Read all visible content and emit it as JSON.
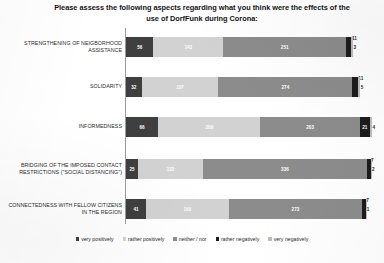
{
  "chart_data": {
    "type": "bar",
    "subtype": "stacked-horizontal-bar",
    "title": "Please assess the following aspects regarding what you think were the effects of the use of DorfFunk during Corona:",
    "xlabel": "",
    "ylabel": "",
    "grid": false,
    "legend_position": "bottom",
    "stacked": true,
    "orientation": "horizontal",
    "categories": [
      "STRENGTHENING OF NEIGBORHOOD ASSISTANCE",
      "SOLIDARITY",
      "INFORMEDNESS",
      "BRIDGING OF THE IMPOSED CONTACT RESTRICTIONS (\"SOCIAL DISTANCING\")",
      "CONNECTEDNESS WITH FELLOW CITIZENS IN THE REGION"
    ],
    "series": [
      {
        "name": "very positively",
        "color": "#3f3f3f",
        "values": [
          56,
          32,
          66,
          25,
          41
        ]
      },
      {
        "name": "rather positively",
        "color": "#d2d2d2",
        "values": [
          143,
          157,
          209,
          132,
          169
        ]
      },
      {
        "name": "neither / nor",
        "color": "#8c8c8c",
        "values": [
          251,
          274,
          203,
          336,
          273
        ]
      },
      {
        "name": "rather negatively",
        "color": "#1c1c1c",
        "values": [
          11,
          11,
          21,
          7,
          7
        ]
      },
      {
        "name": "very negatively",
        "color": "#bdbdbd",
        "values": [
          3,
          5,
          4,
          2,
          1
        ]
      }
    ]
  },
  "rows": [
    {
      "label": "STRENGTHENING OF NEIGBORHOOD ASSISTANCE",
      "segments": [
        {
          "value": "56",
          "inside": true
        },
        {
          "value": "143",
          "inside": true
        },
        {
          "value": "251",
          "inside": true
        },
        {
          "value": "11",
          "inside": false
        },
        {
          "value": "3",
          "inside": false
        }
      ]
    },
    {
      "label": "SOLIDARITY",
      "segments": [
        {
          "value": "32",
          "inside": true
        },
        {
          "value": "157",
          "inside": true
        },
        {
          "value": "274",
          "inside": true
        },
        {
          "value": "11",
          "inside": false
        },
        {
          "value": "5",
          "inside": false
        }
      ]
    },
    {
      "label": "INFORMEDNESS",
      "segments": [
        {
          "value": "66",
          "inside": true
        },
        {
          "value": "209",
          "inside": true
        },
        {
          "value": "203",
          "inside": true
        },
        {
          "value": "21",
          "inside": true
        },
        {
          "value": "4",
          "inside": false
        }
      ]
    },
    {
      "label": "BRIDGING OF THE IMPOSED CONTACT RESTRICTIONS (\"SOCIAL DISTANCING\")",
      "segments": [
        {
          "value": "25",
          "inside": true
        },
        {
          "value": "132",
          "inside": true
        },
        {
          "value": "336",
          "inside": true
        },
        {
          "value": "7",
          "inside": false
        },
        {
          "value": "2",
          "inside": false
        }
      ]
    },
    {
      "label": "CONNECTEDNESS WITH FELLOW CITIZENS IN THE REGION",
      "segments": [
        {
          "value": "41",
          "inside": true
        },
        {
          "value": "169",
          "inside": true
        },
        {
          "value": "273",
          "inside": true
        },
        {
          "value": "7",
          "inside": false
        },
        {
          "value": "1",
          "inside": false
        }
      ]
    }
  ],
  "legend": {
    "items": [
      {
        "label": "very positively",
        "color": "#3f3f3f"
      },
      {
        "label": "rather positively",
        "color": "#d2d2d2"
      },
      {
        "label": "neither / nor",
        "color": "#8c8c8c"
      },
      {
        "label": "rather negatively",
        "color": "#1c1c1c"
      },
      {
        "label": "very negatively",
        "color": "#bdbdbd"
      }
    ]
  }
}
